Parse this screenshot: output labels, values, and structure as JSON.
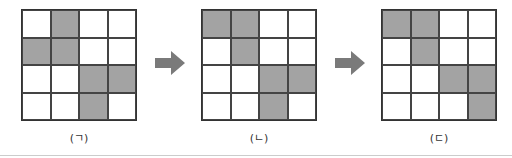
{
  "figure": {
    "panels": [
      {
        "label": "(ㄱ)",
        "rows": 4,
        "cols": 4,
        "shaded": [
          [
            0,
            1
          ],
          [
            1,
            0
          ],
          [
            1,
            1
          ],
          [
            2,
            2
          ],
          [
            2,
            3
          ],
          [
            3,
            2
          ]
        ]
      },
      {
        "label": "(ㄴ)",
        "rows": 4,
        "cols": 4,
        "shaded": [
          [
            0,
            0
          ],
          [
            0,
            1
          ],
          [
            1,
            1
          ],
          [
            2,
            2
          ],
          [
            2,
            3
          ],
          [
            3,
            2
          ]
        ]
      },
      {
        "label": "(ㄷ)",
        "rows": 4,
        "cols": 4,
        "shaded": [
          [
            0,
            0
          ],
          [
            0,
            1
          ],
          [
            1,
            1
          ],
          [
            2,
            2
          ],
          [
            2,
            3
          ],
          [
            3,
            3
          ]
        ]
      }
    ],
    "arrows": [
      {
        "from": "(ㄱ)",
        "to": "(ㄴ)",
        "icon": "right-arrow-icon"
      },
      {
        "from": "(ㄴ)",
        "to": "(ㄷ)",
        "icon": "right-arrow-icon"
      }
    ],
    "colors": {
      "shaded": "#a3a3a3",
      "empty": "#ffffff",
      "grid_line": "#444444",
      "arrow": "#7a7a7a"
    }
  }
}
